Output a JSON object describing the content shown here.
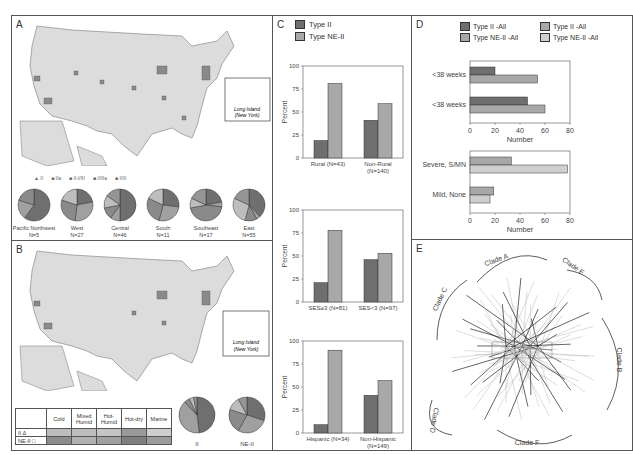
{
  "colors": {
    "type_ii": "#6f6f6f",
    "type_ne_ii": "#a8a8a8",
    "type_ne_ii_light": "#cfcfcf",
    "map_fill": "#dcdcdc",
    "border": "#555555"
  },
  "panel_a": {
    "label": "A",
    "inset_label_1": "Long Island",
    "inset_label_2": "(New York)",
    "legend": [
      {
        "symbol": "triangle",
        "label": "II"
      },
      {
        "symbol": "square",
        "label": "IIa"
      },
      {
        "symbol": "square",
        "label": "II-I/III"
      },
      {
        "symbol": "square",
        "label": "I/IIIa"
      },
      {
        "symbol": "square",
        "label": "I/III"
      }
    ],
    "regions": [
      {
        "name": "Pacific Northwest",
        "n": "N=5",
        "slices": [
          0.6,
          0.2,
          0.2
        ]
      },
      {
        "name": "West",
        "n": "N=27",
        "slices": [
          0.22,
          0.3,
          0.28,
          0.2
        ]
      },
      {
        "name": "Central",
        "n": "N=46",
        "slices": [
          0.5,
          0.1,
          0.12,
          0.13,
          0.15
        ]
      },
      {
        "name": "South",
        "n": "N=11",
        "slices": [
          0.27,
          0.27,
          0.28,
          0.18
        ]
      },
      {
        "name": "Southeast",
        "n": "N=17",
        "slices": [
          0.22,
          0.05,
          0.45,
          0.1,
          0.18
        ]
      },
      {
        "name": "East",
        "n": "N=55",
        "slices": [
          0.38,
          0.04,
          0.12,
          0.28,
          0.18
        ]
      }
    ]
  },
  "panel_b": {
    "label": "B",
    "inset_label_1": "Long Island",
    "inset_label_2": "(New York)",
    "table": {
      "columns": [
        "Cold",
        "Mixed Humid",
        "Hot-Humid",
        "Hot-dry",
        "Marine"
      ],
      "rows": [
        {
          "label": "II",
          "symbol": "Δ"
        },
        {
          "label": "NE-II",
          "symbol": "□"
        }
      ]
    },
    "pies": [
      {
        "label": "II",
        "slices": [
          0.48,
          0.4,
          0.05,
          0.04,
          0.03
        ]
      },
      {
        "label": "NE-II",
        "slices": [
          0.3,
          0.28,
          0.22,
          0.12,
          0.08
        ]
      }
    ]
  },
  "chart_data": [
    {
      "type": "bar",
      "panel": "C",
      "legend": [
        "Type II",
        "Type NE-II"
      ],
      "ylabel": "Percent",
      "ylim": [
        0,
        100
      ],
      "yticks": [
        "0",
        "25",
        "50",
        "75",
        "100"
      ],
      "charts": [
        {
          "categories": [
            "Rural (N=43)",
            "Non-Rural (N=140)"
          ],
          "series": [
            {
              "name": "Type II",
              "values": [
                19,
                41
              ]
            },
            {
              "name": "Type NE-II",
              "values": [
                81,
                59
              ]
            }
          ]
        },
        {
          "categories": [
            "SES≥3 (N=81)",
            "SES<3 (N=97)"
          ],
          "series": [
            {
              "name": "Type II",
              "values": [
                21,
                46
              ]
            },
            {
              "name": "Type NE-II",
              "values": [
                78,
                53
              ]
            }
          ]
        },
        {
          "categories": [
            "Hispanic (N=34)",
            "Non-Hispanic (N=149)"
          ],
          "series": [
            {
              "name": "Type II",
              "values": [
                9,
                41
              ]
            },
            {
              "name": "Type NE-II",
              "values": [
                90,
                57
              ]
            }
          ]
        }
      ]
    },
    {
      "type": "bar",
      "panel": "D",
      "orientation": "horizontal",
      "legend": [
        "Type II -All",
        "Type II -All",
        "Type NE-II -All",
        "Type NE-II -All"
      ],
      "xlabel": "Number",
      "xlim": [
        0,
        80
      ],
      "xticks": [
        "0",
        "20",
        "40",
        "60",
        "80"
      ],
      "charts": [
        {
          "categories": [
            "<38 weeks",
            "<38 weeks"
          ],
          "series": [
            {
              "name": "Type II -All",
              "values": [
                20,
                46
              ]
            },
            {
              "name": "Type NE-II -All",
              "values": [
                54,
                60
              ]
            }
          ]
        },
        {
          "categories": [
            "Severe, S/MN",
            "Mild, None"
          ],
          "series": [
            {
              "name": "Type II -All",
              "values": [
                33,
                19
              ]
            },
            {
              "name": "Type NE-II -All",
              "values": [
                78,
                16
              ]
            }
          ]
        }
      ]
    }
  ],
  "panel_c": {
    "label": "C"
  },
  "panel_d": {
    "label": "D"
  },
  "panel_e": {
    "label": "E",
    "clades": [
      "Clade A",
      "Clade E",
      "Clade B",
      "Clade F",
      "Clade D",
      "Clade C"
    ]
  }
}
